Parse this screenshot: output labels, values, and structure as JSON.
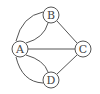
{
  "diagram": {
    "type": "graph",
    "colors": {
      "stroke": "#555555",
      "label": "#444444",
      "background": "#ffffff"
    },
    "nodes": [
      {
        "id": "A",
        "label": "A",
        "x": 20,
        "y": 49
      },
      {
        "id": "B",
        "label": "B",
        "x": 51,
        "y": 15
      },
      {
        "id": "C",
        "label": "C",
        "x": 83,
        "y": 49
      },
      {
        "id": "D",
        "label": "D",
        "x": 51,
        "y": 80
      }
    ],
    "edges": [
      {
        "from": "A",
        "to": "B",
        "shape": "curve-outer"
      },
      {
        "from": "A",
        "to": "B",
        "shape": "curve-inner"
      },
      {
        "from": "A",
        "to": "D",
        "shape": "curve-outer"
      },
      {
        "from": "A",
        "to": "D",
        "shape": "curve-inner"
      },
      {
        "from": "A",
        "to": "C",
        "shape": "straight"
      },
      {
        "from": "B",
        "to": "C",
        "shape": "straight"
      },
      {
        "from": "D",
        "to": "C",
        "shape": "straight"
      }
    ]
  }
}
